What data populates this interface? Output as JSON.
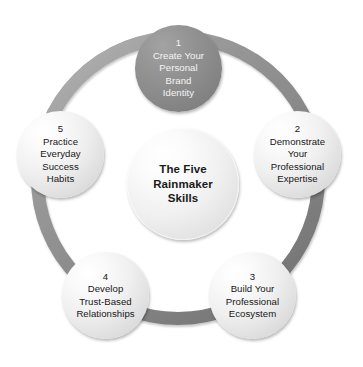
{
  "diagram": {
    "type": "cycle-diagram",
    "hub": {
      "label": "The Five\nRainmaker\nSkills",
      "lines": [
        "The Five",
        "Rainmaker",
        "Skills"
      ]
    },
    "nodes": [
      {
        "number": "1",
        "lines": [
          "Create Your",
          "Personal",
          "Brand",
          "Identity"
        ],
        "text": "1\nCreate Your\nPersonal\nBrand\nIdentity",
        "fill": "#8b8b8b",
        "text_color": "#f4f4f4",
        "position": "top"
      },
      {
        "number": "2",
        "lines": [
          "Demonstrate",
          "Your",
          "Professional",
          "Expertise"
        ],
        "text": "2\nDemonstrate\nYour\nProfessional\nExpertise",
        "fill": "#eeeeee",
        "text_color": "#171717",
        "position": "right"
      },
      {
        "number": "3",
        "lines": [
          "Build Your",
          "Professional",
          "Ecosystem"
        ],
        "text": "3\nBuild Your\nProfessional\nEcosystem",
        "fill": "#eeeeee",
        "text_color": "#171717",
        "position": "bottom-right"
      },
      {
        "number": "4",
        "lines": [
          "Develop",
          "Trust-Based",
          "Relationships"
        ],
        "text": "4\nDevelop\nTrust-Based\nRelationships",
        "fill": "#eeeeee",
        "text_color": "#171717",
        "position": "bottom-left"
      },
      {
        "number": "5",
        "lines": [
          "Practice",
          "Everyday",
          "Success",
          "Habits"
        ],
        "text": "5\nPractice\nEveryday\nSuccess\nHabits",
        "fill": "#eeeeee",
        "text_color": "#171717",
        "position": "left"
      }
    ],
    "ring": {
      "color": "#8e8e8e",
      "band_thickness_px": 13
    },
    "background": "#ffffff"
  }
}
